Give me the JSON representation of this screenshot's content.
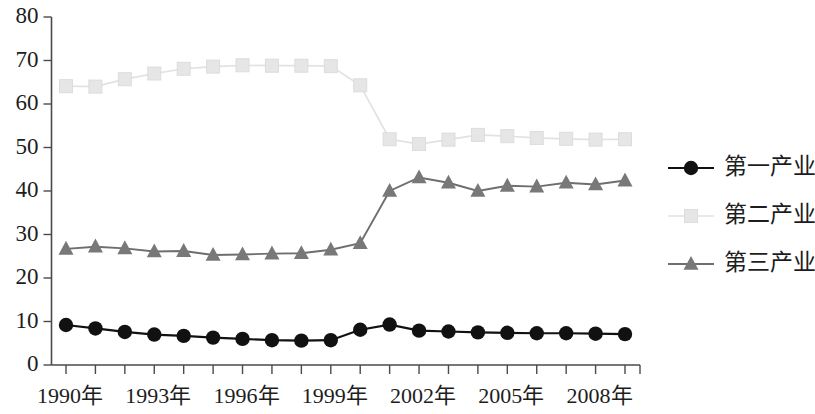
{
  "chart_data": {
    "type": "line",
    "title": "",
    "subtitle": "",
    "xlabel": "",
    "ylabel": "",
    "ylim": [
      0,
      80
    ],
    "ytick_values": [
      0,
      10,
      20,
      30,
      40,
      50,
      60,
      70,
      80
    ],
    "ytick_labels": [
      "0",
      "10",
      "20",
      "30",
      "40",
      "50",
      "60",
      "70",
      "80"
    ],
    "grid": false,
    "legend_position": "right",
    "x": [
      1990,
      1991,
      1992,
      1993,
      1994,
      1995,
      1996,
      1997,
      1998,
      1999,
      2000,
      2001,
      2002,
      2003,
      2004,
      2005,
      2006,
      2007,
      2008,
      2009
    ],
    "xtick_labels": [
      "1990年",
      "",
      "",
      "1993年",
      "",
      "",
      "1996年",
      "",
      "",
      "1999年",
      "",
      "",
      "2002年",
      "",
      "",
      "2005年",
      "",
      "",
      "2008年",
      ""
    ],
    "xtick_labeled": [
      {
        "x": 1990,
        "label": "1990年"
      },
      {
        "x": 1993,
        "label": "1993年"
      },
      {
        "x": 1996,
        "label": "1996年"
      },
      {
        "x": 1999,
        "label": "1999年"
      },
      {
        "x": 2002,
        "label": "2002年"
      },
      {
        "x": 2005,
        "label": "2005年"
      },
      {
        "x": 2008,
        "label": "2008年"
      }
    ],
    "series": [
      {
        "name": "第一产业",
        "marker": "circle",
        "color": "#111111",
        "values": [
          9.2,
          8.4,
          7.6,
          7.0,
          6.7,
          6.3,
          6.0,
          5.7,
          5.6,
          5.7,
          8.1,
          9.3,
          7.9,
          7.7,
          7.5,
          7.4,
          7.3,
          7.3,
          7.2,
          7.1
        ]
      },
      {
        "name": "第二产业",
        "marker": "square",
        "color": "#e6e6e6",
        "values": [
          64.1,
          64.0,
          65.7,
          67.0,
          68.1,
          68.6,
          68.9,
          68.8,
          68.8,
          68.7,
          64.3,
          51.9,
          50.8,
          51.8,
          52.9,
          52.6,
          52.2,
          52.0,
          51.8,
          51.9
        ]
      },
      {
        "name": "第三产业",
        "marker": "triangle",
        "color": "#787878",
        "values": [
          26.7,
          27.2,
          26.8,
          26.1,
          26.2,
          25.3,
          25.4,
          25.6,
          25.7,
          26.5,
          28.0,
          40.0,
          43.1,
          41.9,
          40.0,
          41.2,
          41.0,
          41.9,
          41.5,
          42.4
        ]
      }
    ],
    "legend": [
      {
        "label": "第一产业",
        "marker": "circle",
        "color": "#111111"
      },
      {
        "label": "第二产业",
        "marker": "square",
        "color": "#e6e6e6"
      },
      {
        "label": "第三产业",
        "marker": "triangle",
        "color": "#787878"
      }
    ]
  },
  "axes": {
    "y_axis_name": "y-axis",
    "x_axis_name": "x-axis"
  }
}
